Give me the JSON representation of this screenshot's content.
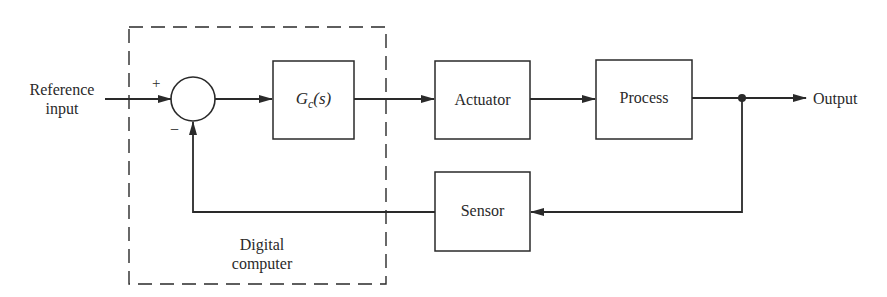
{
  "diagram": {
    "type": "feedback-control-block-diagram",
    "colors": {
      "line": "#2a2a2a",
      "background": "#ffffff"
    },
    "input_label_line1": "Reference",
    "input_label_line2": "input",
    "output_label": "Output",
    "sum_junction": {
      "plus_sign": "+",
      "minus_sign": "−"
    },
    "blocks": {
      "controller": {
        "symbol": "G",
        "subscript": "c",
        "arg": "(s)"
      },
      "actuator": "Actuator",
      "process": "Process",
      "sensor": "Sensor"
    },
    "group": {
      "label_line1": "Digital",
      "label_line2": "computer"
    }
  }
}
